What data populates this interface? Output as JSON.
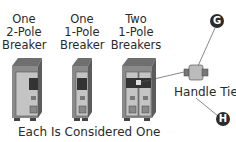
{
  "labels": {
    "two_pole": [
      "One",
      "2-Pole",
      "Breaker"
    ],
    "one_pole": [
      "One",
      "1-Pole",
      "Breaker"
    ],
    "two_one_pole": [
      "Two",
      "1-Pole",
      "Breakers"
    ]
  },
  "caption": "Each Is Considered One",
  "handle_tie_label": "Handle Tie",
  "callouts": {
    "g": "G",
    "h": "H"
  },
  "colors": {
    "breaker_body": "#8a8a8a",
    "breaker_face": "#b5b5b5",
    "breaker_dark": "#3a3a3a",
    "callout_fill": "#2b2b2b"
  }
}
